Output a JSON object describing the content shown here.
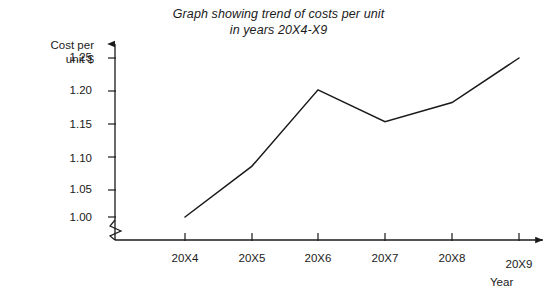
{
  "chart_data": {
    "type": "line",
    "title": "Graph showing trend of costs per unit in years 20X4-X9",
    "title_lines": [
      "Graph showing trend of costs per unit",
      "in years 20X4-X9"
    ],
    "xlabel": "Year",
    "ylabel": "Cost per unit $",
    "ylabel_lines": [
      "Cost per",
      "unit $"
    ],
    "categories": [
      "20X4",
      "20X5",
      "20X6",
      "20X7",
      "20X8",
      "20X9"
    ],
    "values": [
      1.0,
      1.08,
      1.2,
      1.15,
      1.18,
      1.25
    ],
    "ytick_labels": [
      "1.25",
      "1.20",
      "1.15",
      "1.10",
      "1.05",
      "1.00"
    ],
    "yticks": [
      1.25,
      1.2,
      1.15,
      1.1,
      1.05,
      1.0
    ],
    "ylim": [
      1.0,
      1.25
    ],
    "grid": false,
    "legend": null,
    "axis_break": "y-axis zigzag break below 1.00",
    "line_color": "#1a1a1a",
    "background_color": "#ffffff",
    "series_name": "Cost per unit $"
  }
}
